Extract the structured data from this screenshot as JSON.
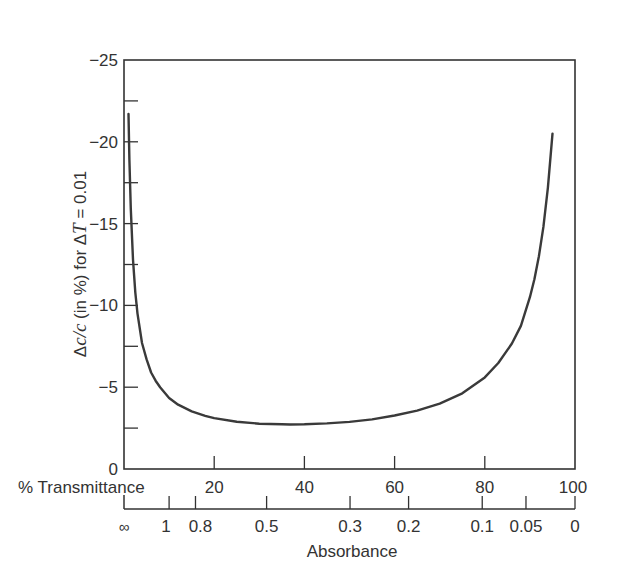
{
  "chart_data": {
    "type": "line",
    "title": "",
    "ylabel_parts": {
      "delta1": "Δ",
      "c1": "c",
      "slash": "/",
      "c2": "c",
      "mid": " (in %) for Δ",
      "T": "T",
      "tail": " = 0.01"
    },
    "ylabel": "Δc/c (in %) for ΔT = 0.01",
    "xlabel": "% Transmittance",
    "x2label": "Absorbance",
    "ylim": [
      0,
      -25
    ],
    "xlim": [
      0,
      100
    ],
    "y_ticks": [
      {
        "value": -25,
        "label": "−25"
      },
      {
        "value": -20,
        "label": "−20"
      },
      {
        "value": -15,
        "label": "−15"
      },
      {
        "value": -10,
        "label": "−10"
      },
      {
        "value": -5,
        "label": "−5"
      },
      {
        "value": 0,
        "label": "0"
      }
    ],
    "y_minor_ticks": [
      -22.5,
      -17.5,
      -12.5,
      -7.5,
      -2.5
    ],
    "x_ticks": [
      {
        "value": 20,
        "label": "20"
      },
      {
        "value": 40,
        "label": "40"
      },
      {
        "value": 60,
        "label": "60"
      },
      {
        "value": 80,
        "label": "80"
      },
      {
        "value": 100,
        "label": "100"
      }
    ],
    "absorbance_ticks": [
      {
        "value": "∞",
        "T": 0,
        "label": "∞",
        "tick": false
      },
      {
        "value": 1,
        "T": 10,
        "label": "1",
        "tick": true
      },
      {
        "value": 0.8,
        "T": 15.85,
        "label": "0.8",
        "tick": true
      },
      {
        "value": 0.5,
        "T": 31.62,
        "label": "0.5",
        "tick": true
      },
      {
        "value": 0.3,
        "T": 50.12,
        "label": "0.3",
        "tick": true
      },
      {
        "value": 0.2,
        "T": 63.1,
        "label": "0.2",
        "tick": true
      },
      {
        "value": 0.1,
        "T": 79.43,
        "label": "0.1",
        "tick": true
      },
      {
        "value": 0.05,
        "T": 89.13,
        "label": "0.05",
        "tick": true
      },
      {
        "value": 0,
        "T": 100,
        "label": "0",
        "tick": true
      }
    ],
    "series": [
      {
        "name": "Δc/c vs %T",
        "x": [
          1.0,
          1.2,
          1.5,
          2,
          2.5,
          3,
          4,
          5,
          6,
          7,
          8,
          10,
          12,
          15,
          18,
          20,
          25,
          30,
          35,
          36.8,
          40,
          45,
          50,
          55,
          60,
          65,
          70,
          75,
          80,
          83,
          86,
          88,
          90,
          91,
          92,
          93,
          94,
          95
        ],
        "y": [
          -21.7,
          -18.9,
          -15.9,
          -12.8,
          -10.8,
          -9.5,
          -7.7,
          -6.7,
          -5.9,
          -5.4,
          -5.0,
          -4.34,
          -3.93,
          -3.52,
          -3.25,
          -3.11,
          -2.89,
          -2.77,
          -2.73,
          -2.72,
          -2.73,
          -2.79,
          -2.88,
          -3.03,
          -3.27,
          -3.57,
          -4.0,
          -4.63,
          -5.6,
          -6.48,
          -7.67,
          -8.75,
          -10.5,
          -11.6,
          -13.0,
          -14.8,
          -17.2,
          -20.5
        ],
        "color": "#3a3a3a"
      }
    ],
    "grid": false,
    "legend": null
  },
  "axes": {
    "transmittance_label": "% Transmittance",
    "absorbance_label": "Absorbance"
  }
}
